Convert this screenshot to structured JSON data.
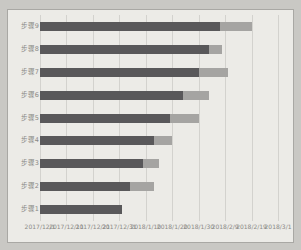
{
  "chart_data": {
    "type": "bar",
    "orientation": "horizontal",
    "stacked": true,
    "title": "",
    "legend": false,
    "grid": true,
    "categories": [
      "步骤1",
      "步骤2",
      "步骤3",
      "步骤4",
      "步骤5",
      "步骤6",
      "步骤7",
      "步骤8",
      "步骤9"
    ],
    "series": [
      {
        "name": "series_1_dark",
        "color": "#59585a",
        "values": [
          31,
          34,
          39,
          43,
          49,
          54,
          60,
          64,
          68
        ]
      },
      {
        "name": "series_2_light",
        "color": "#a5a4a2",
        "values": [
          0,
          9,
          6,
          7,
          11,
          10,
          11,
          5,
          12
        ]
      }
    ],
    "value_unit": "days_from_2017_12_1",
    "x_axis": {
      "tick_labels": [
        "2017/12/1",
        "2017/12/11",
        "2017/12/21",
        "2017/12/31",
        "2018/1/10",
        "2018/1/20",
        "2018/1/30",
        "2018/2/9",
        "2018/2/19",
        "2018/3/1"
      ],
      "tick_values": [
        0,
        10,
        20,
        30,
        40,
        50,
        60,
        70,
        80,
        90
      ],
      "range": [
        0,
        90
      ]
    }
  },
  "colors": {
    "page_background": "#c9c8c4",
    "panel_background": "#ecebe7",
    "panel_border": "#a9a8a4",
    "gridline": "#d3d2ce",
    "axis_text": "#8a8986",
    "bar_dark": "#59585a",
    "bar_light": "#a5a4a2"
  }
}
